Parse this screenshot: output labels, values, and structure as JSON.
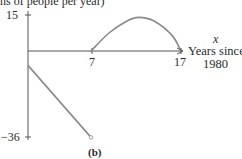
{
  "chart_data": {
    "type": "line",
    "panel_label": "(b)",
    "ylabel_fragment": "ns of people per year)",
    "xlabel_var": "x",
    "xlabel": [
      "Years since",
      "1980"
    ],
    "y_ticks": [
      15,
      -36
    ],
    "x_ticks": [
      7,
      17
    ],
    "xlim": [
      0,
      17
    ],
    "ylim": [
      -36,
      15
    ],
    "grid": false,
    "series": [
      {
        "name": "segment-1",
        "style": "line",
        "points": [
          [
            0,
            -6
          ],
          [
            7,
            -36
          ]
        ],
        "end_marker": "open-circle"
      },
      {
        "name": "segment-2",
        "style": "curve",
        "points": [
          [
            7,
            0
          ],
          [
            9,
            7.5
          ],
          [
            11,
            12.5
          ],
          [
            12.3,
            14
          ],
          [
            14,
            12.5
          ],
          [
            16,
            6.5
          ],
          [
            17,
            0
          ]
        ]
      }
    ],
    "line_color": "#8a8a8a",
    "axis_color": "#555555"
  }
}
